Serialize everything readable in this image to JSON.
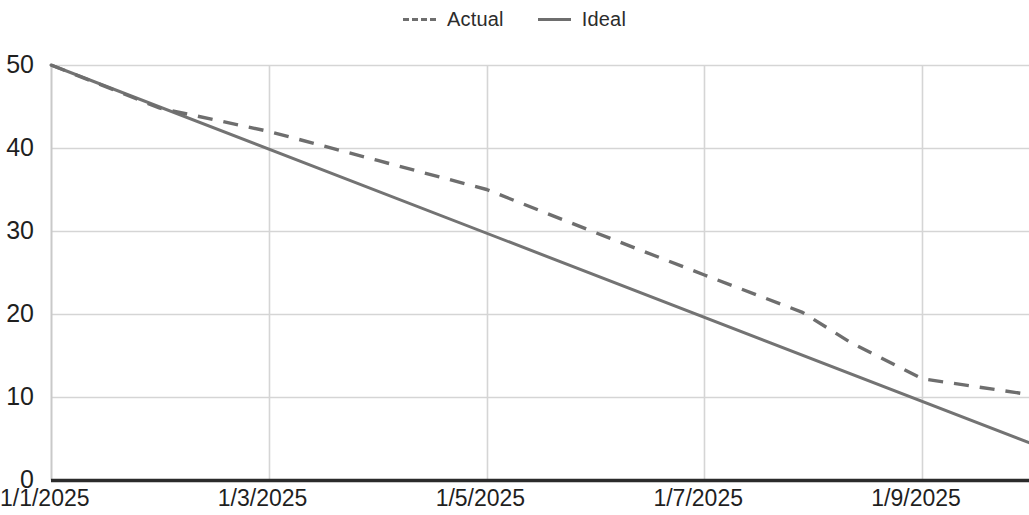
{
  "chart_data": {
    "type": "line",
    "title": "",
    "subtitle": "",
    "xlabel": "",
    "ylabel": "",
    "x": [
      "1/1/2025",
      "1/2/2025",
      "1/3/2025",
      "1/4/2025",
      "1/5/2025",
      "1/6/2025",
      "1/7/2025",
      "1/8/2025",
      "1/8/2025b",
      "1/9/2025",
      "1/10/2025"
    ],
    "x_tick_labels": [
      "1/1/2025",
      "1/3/2025",
      "1/5/2025",
      "1/7/2025",
      "1/9/2025"
    ],
    "x_tick_values": [
      1,
      3,
      5,
      7,
      9
    ],
    "y_tick_labels": [
      "0",
      "10",
      "20",
      "30",
      "40",
      "50"
    ],
    "y_tick_values": [
      0,
      10,
      20,
      30,
      40,
      50
    ],
    "xlim": [
      1,
      9.98
    ],
    "ylim": [
      0,
      50
    ],
    "grid": true,
    "legend_position": "top-center",
    "series": [
      {
        "name": "Actual",
        "style": "dashed",
        "color": "#6e6e6e",
        "x": [
          1,
          2,
          3,
          4,
          5,
          6,
          7,
          7.9,
          8.35,
          9,
          9.98
        ],
        "values": [
          50,
          44.8,
          42,
          38.5,
          35,
          29.8,
          24.7,
          20.2,
          16.5,
          12.2,
          10.3
        ]
      },
      {
        "name": "Ideal",
        "style": "solid",
        "color": "#737373",
        "x": [
          1,
          9.98
        ],
        "values": [
          50,
          4.5
        ]
      }
    ]
  },
  "legend": {
    "items": [
      {
        "label": "Actual",
        "marker": "dashed-line-icon"
      },
      {
        "label": "Ideal",
        "marker": "solid-line-icon"
      }
    ]
  },
  "colors": {
    "actual": "#6e6e6e",
    "ideal": "#737373",
    "grid": "#d5d5d5",
    "axis": "#2b2b2b",
    "text": "#1f1f1f",
    "background": "#ffffff"
  }
}
